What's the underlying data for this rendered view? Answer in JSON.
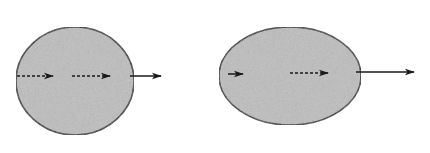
{
  "diagram": {
    "colors": {
      "fill": "#bdbdbd",
      "stroke": "#2a2a2a",
      "arrow": "#1a1a1a",
      "background": "#ffffff"
    },
    "shapes": [
      {
        "id": "round-blob",
        "kind": "circle-like",
        "cx": 75,
        "cy": 81,
        "rx": 59,
        "ry": 54,
        "arrows": [
          {
            "x1": 17,
            "x2": 53,
            "y": 76,
            "style": "dashed",
            "head": "small"
          },
          {
            "x1": 72,
            "x2": 110,
            "y": 76,
            "style": "dashed",
            "head": "small"
          },
          {
            "x1": 130,
            "x2": 161,
            "y": 76,
            "style": "solid",
            "head": "small"
          }
        ]
      },
      {
        "id": "oval-blob",
        "kind": "ellipse",
        "cx": 290,
        "cy": 76,
        "rx": 71,
        "ry": 49,
        "arrows": [
          {
            "x1": 228,
            "x2": 243,
            "y": 74,
            "style": "solid",
            "head": "small"
          },
          {
            "x1": 290,
            "x2": 328,
            "y": 73,
            "style": "dashed",
            "head": "small"
          },
          {
            "x1": 356,
            "x2": 414,
            "y": 72,
            "style": "solid",
            "head": "small"
          }
        ]
      }
    ]
  }
}
